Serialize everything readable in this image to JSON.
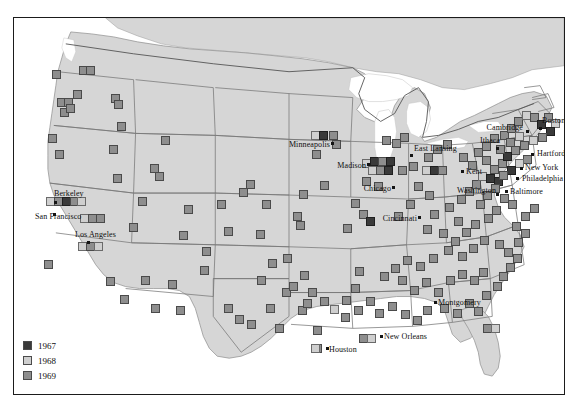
{
  "figure": {
    "type": "map",
    "title": "",
    "frame": {
      "border_color": "#1b1b1b",
      "background": "#ffffff"
    },
    "palette": {
      "land": "#d6d6d6",
      "water": "#ffffff",
      "state_border": "#6e6e6e",
      "country_border": "#555555",
      "label_text": "#0e0e0e",
      "year_1967": "#3a3a3a",
      "year_1968": "#cfcfcf",
      "year_1969": "#8e8e8e"
    }
  },
  "legend": {
    "position": "bottom-left",
    "items": [
      {
        "label": "1967",
        "color": "#3a3a3a",
        "key": "year-1967"
      },
      {
        "label": "1968",
        "color": "#cfcfcf",
        "key": "year-1968"
      },
      {
        "label": "1969",
        "color": "#8e8e8e",
        "key": "year-1969"
      }
    ]
  },
  "city_labels": [
    {
      "name": "Minneapolis",
      "text": "Minneapolis",
      "x": 316,
      "y": 127,
      "anchor": "right",
      "dot_x": 318,
      "dot_y": 125
    },
    {
      "name": "Madison",
      "text": "Madison",
      "x": 352,
      "y": 148,
      "anchor": "right",
      "dot_x": 354,
      "dot_y": 146
    },
    {
      "name": "Chicago",
      "text": "Chicago",
      "x": 377,
      "y": 171,
      "anchor": "right",
      "dot_x": 379,
      "dot_y": 169
    },
    {
      "name": "Cincinnati",
      "text": "Cincinnati",
      "x": 403,
      "y": 201,
      "anchor": "right",
      "dot_x": 405,
      "dot_y": 199
    },
    {
      "name": "East Lansing",
      "text": "East Lansing",
      "x": 400,
      "y": 131,
      "anchor": "left",
      "dot_x": 397,
      "dot_y": 137
    },
    {
      "name": "Kent",
      "text": "Kent",
      "x": 452,
      "y": 154,
      "anchor": "left",
      "dot_x": 448,
      "dot_y": 153
    },
    {
      "name": "Ithaca",
      "text": "Ithaca",
      "x": 466,
      "y": 123,
      "anchor": "left",
      "dot_x": 483,
      "dot_y": 130
    },
    {
      "name": "Cambridge",
      "text": "Cambridge",
      "x": 509,
      "y": 110,
      "anchor": "right",
      "dot_x": 513,
      "dot_y": 113
    },
    {
      "name": "Boston",
      "text": "Boston",
      "x": 528,
      "y": 103,
      "anchor": "left",
      "dot_x": 526,
      "dot_y": 110
    },
    {
      "name": "Hartford",
      "text": "Hartford",
      "x": 523,
      "y": 136,
      "anchor": "left",
      "dot_x": 518,
      "dot_y": 136
    },
    {
      "name": "New York",
      "text": "New York",
      "x": 511,
      "y": 150,
      "anchor": "left",
      "dot_x": 507,
      "dot_y": 150
    },
    {
      "name": "Philadelphia",
      "text": "Philadelphia",
      "x": 508,
      "y": 161,
      "anchor": "left",
      "dot_x": 503,
      "dot_y": 160
    },
    {
      "name": "Baltimore",
      "text": "Baltimore",
      "x": 496,
      "y": 174,
      "anchor": "left",
      "dot_x": 492,
      "dot_y": 173
    },
    {
      "name": "Washington",
      "text": "Washington",
      "x": 482,
      "y": 173,
      "anchor": "right",
      "dot_x": 483,
      "dot_y": 176
    },
    {
      "name": "Berkeley",
      "text": "Berkeley",
      "x": 40,
      "y": 176,
      "anchor": "left",
      "dot_x": 41,
      "dot_y": 184
    },
    {
      "name": "San Francisco",
      "text": "San Francisco",
      "x": 21,
      "y": 199,
      "anchor": "left",
      "dot_x": 40,
      "dot_y": 196
    },
    {
      "name": "Los Angeles",
      "text": "Los Angeles",
      "x": 61,
      "y": 217,
      "anchor": "left",
      "dot_x": 74,
      "dot_y": 224
    },
    {
      "name": "Houston",
      "text": "Houston",
      "x": 315,
      "y": 332,
      "anchor": "left",
      "dot_x": 313,
      "dot_y": 330
    },
    {
      "name": "New Orleans",
      "text": "New Orleans",
      "x": 370,
      "y": 319,
      "anchor": "left",
      "dot_x": 367,
      "dot_y": 318
    },
    {
      "name": "Montgomery",
      "text": "Montgomery",
      "x": 424,
      "y": 285,
      "anchor": "left",
      "dot_x": 421,
      "dot_y": 284
    }
  ],
  "markers": [
    {
      "year": "1969",
      "x": 42,
      "y": 56
    },
    {
      "year": "1969",
      "x": 69,
      "y": 52
    },
    {
      "year": "1969",
      "x": 76,
      "y": 52
    },
    {
      "year": "1969",
      "x": 63,
      "y": 76
    },
    {
      "year": "1969",
      "x": 47,
      "y": 84
    },
    {
      "year": "1969",
      "x": 54,
      "y": 84
    },
    {
      "year": "1969",
      "x": 50,
      "y": 94
    },
    {
      "year": "1969",
      "x": 56,
      "y": 90
    },
    {
      "year": "1969",
      "x": 101,
      "y": 80
    },
    {
      "year": "1969",
      "x": 104,
      "y": 86
    },
    {
      "year": "1969",
      "x": 107,
      "y": 108
    },
    {
      "year": "1969",
      "x": 38,
      "y": 120
    },
    {
      "year": "1969",
      "x": 45,
      "y": 136
    },
    {
      "year": "1969",
      "x": 99,
      "y": 131
    },
    {
      "year": "1968",
      "x": 36,
      "y": 183
    },
    {
      "year": "1969",
      "x": 44,
      "y": 183
    },
    {
      "year": "1967",
      "x": 52,
      "y": 183
    },
    {
      "year": "1969",
      "x": 60,
      "y": 183
    },
    {
      "year": "1968",
      "x": 67,
      "y": 183
    },
    {
      "year": "1968",
      "x": 70,
      "y": 200
    },
    {
      "year": "1969",
      "x": 78,
      "y": 200
    },
    {
      "year": "1969",
      "x": 86,
      "y": 200
    },
    {
      "year": "1968",
      "x": 68,
      "y": 228
    },
    {
      "year": "1969",
      "x": 76,
      "y": 228
    },
    {
      "year": "1968",
      "x": 84,
      "y": 228
    },
    {
      "year": "1969",
      "x": 34,
      "y": 246
    },
    {
      "year": "1969",
      "x": 103,
      "y": 160
    },
    {
      "year": "1969",
      "x": 145,
      "y": 158
    },
    {
      "year": "1969",
      "x": 140,
      "y": 150
    },
    {
      "year": "1969",
      "x": 151,
      "y": 122
    },
    {
      "year": "1969",
      "x": 207,
      "y": 186
    },
    {
      "year": "1969",
      "x": 131,
      "y": 262
    },
    {
      "year": "1969",
      "x": 158,
      "y": 266
    },
    {
      "year": "1969",
      "x": 190,
      "y": 252
    },
    {
      "year": "1969",
      "x": 258,
      "y": 245
    },
    {
      "year": "1969",
      "x": 247,
      "y": 262
    },
    {
      "year": "1969",
      "x": 272,
      "y": 274
    },
    {
      "year": "1969",
      "x": 279,
      "y": 268
    },
    {
      "year": "1969",
      "x": 288,
      "y": 292
    },
    {
      "year": "1969",
      "x": 225,
      "y": 301
    },
    {
      "year": "1969",
      "x": 192,
      "y": 233
    },
    {
      "year": "1969",
      "x": 214,
      "y": 213
    },
    {
      "year": "1969",
      "x": 246,
      "y": 216
    },
    {
      "year": "1969",
      "x": 252,
      "y": 186
    },
    {
      "year": "1969",
      "x": 174,
      "y": 191
    },
    {
      "year": "1969",
      "x": 283,
      "y": 198
    },
    {
      "year": "1969",
      "x": 289,
      "y": 176
    },
    {
      "year": "1968",
      "x": 301,
      "y": 117
    },
    {
      "year": "1967",
      "x": 309,
      "y": 117
    },
    {
      "year": "1969",
      "x": 319,
      "y": 117
    },
    {
      "year": "1969",
      "x": 322,
      "y": 126
    },
    {
      "year": "1969",
      "x": 273,
      "y": 240
    },
    {
      "year": "1969",
      "x": 290,
      "y": 257
    },
    {
      "year": "1969",
      "x": 256,
      "y": 290
    },
    {
      "year": "1969",
      "x": 265,
      "y": 310
    },
    {
      "year": "1969",
      "x": 293,
      "y": 285
    },
    {
      "year": "1969",
      "x": 303,
      "y": 312
    },
    {
      "year": "1969",
      "x": 303,
      "y": 330
    },
    {
      "year": "1968",
      "x": 301,
      "y": 330
    },
    {
      "year": "1969",
      "x": 331,
      "y": 299
    },
    {
      "year": "1969",
      "x": 341,
      "y": 270
    },
    {
      "year": "1969",
      "x": 349,
      "y": 320
    },
    {
      "year": "1968",
      "x": 357,
      "y": 320
    },
    {
      "year": "1969",
      "x": 345,
      "y": 253
    },
    {
      "year": "1968",
      "x": 352,
      "y": 145
    },
    {
      "year": "1967",
      "x": 360,
      "y": 143
    },
    {
      "year": "1969",
      "x": 368,
      "y": 143
    },
    {
      "year": "1967",
      "x": 376,
      "y": 143
    },
    {
      "year": "1968",
      "x": 358,
      "y": 152
    },
    {
      "year": "1969",
      "x": 366,
      "y": 152
    },
    {
      "year": "1967",
      "x": 374,
      "y": 152
    },
    {
      "year": "1969",
      "x": 352,
      "y": 163
    },
    {
      "year": "1969",
      "x": 364,
      "y": 168
    },
    {
      "year": "1969",
      "x": 341,
      "y": 185
    },
    {
      "year": "1969",
      "x": 349,
      "y": 196
    },
    {
      "year": "1967",
      "x": 356,
      "y": 203
    },
    {
      "year": "1969",
      "x": 333,
      "y": 210
    },
    {
      "year": "1969",
      "x": 302,
      "y": 136
    },
    {
      "year": "1969",
      "x": 310,
      "y": 167
    },
    {
      "year": "1969",
      "x": 286,
      "y": 207
    },
    {
      "year": "1969",
      "x": 372,
      "y": 122
    },
    {
      "year": "1969",
      "x": 382,
      "y": 125
    },
    {
      "year": "1969",
      "x": 390,
      "y": 119
    },
    {
      "year": "1969",
      "x": 399,
      "y": 148
    },
    {
      "year": "1969",
      "x": 388,
      "y": 152
    },
    {
      "year": "1968",
      "x": 412,
      "y": 152
    },
    {
      "year": "1967",
      "x": 420,
      "y": 152
    },
    {
      "year": "1969",
      "x": 428,
      "y": 152
    },
    {
      "year": "1969",
      "x": 414,
      "y": 139
    },
    {
      "year": "1969",
      "x": 423,
      "y": 131
    },
    {
      "year": "1969",
      "x": 433,
      "y": 126
    },
    {
      "year": "1969",
      "x": 404,
      "y": 168
    },
    {
      "year": "1969",
      "x": 415,
      "y": 177
    },
    {
      "year": "1969",
      "x": 396,
      "y": 186
    },
    {
      "year": "1969",
      "x": 384,
      "y": 198
    },
    {
      "year": "1969",
      "x": 420,
      "y": 196
    },
    {
      "year": "1969",
      "x": 413,
      "y": 211
    },
    {
      "year": "1969",
      "x": 429,
      "y": 215
    },
    {
      "year": "1969",
      "x": 444,
      "y": 203
    },
    {
      "year": "1969",
      "x": 435,
      "y": 189
    },
    {
      "year": "1969",
      "x": 447,
      "y": 181
    },
    {
      "year": "1969",
      "x": 455,
      "y": 173
    },
    {
      "year": "1969",
      "x": 462,
      "y": 166
    },
    {
      "year": "1968",
      "x": 468,
      "y": 158
    },
    {
      "year": "1969",
      "x": 458,
      "y": 147
    },
    {
      "year": "1969",
      "x": 449,
      "y": 139
    },
    {
      "year": "1969",
      "x": 464,
      "y": 134
    },
    {
      "year": "1969",
      "x": 472,
      "y": 142
    },
    {
      "year": "1967",
      "x": 476,
      "y": 160
    },
    {
      "year": "1967",
      "x": 484,
      "y": 163
    },
    {
      "year": "1969",
      "x": 480,
      "y": 151
    },
    {
      "year": "1969",
      "x": 488,
      "y": 145
    },
    {
      "year": "1969",
      "x": 472,
      "y": 128
    },
    {
      "year": "1969",
      "x": 480,
      "y": 120
    },
    {
      "year": "1969",
      "x": 490,
      "y": 117
    },
    {
      "year": "1969",
      "x": 497,
      "y": 110
    },
    {
      "year": "1969",
      "x": 504,
      "y": 103
    },
    {
      "year": "1968",
      "x": 512,
      "y": 97
    },
    {
      "year": "1969",
      "x": 520,
      "y": 99
    },
    {
      "year": "1967",
      "x": 527,
      "y": 106
    },
    {
      "year": "1969",
      "x": 534,
      "y": 99
    },
    {
      "year": "1968",
      "x": 541,
      "y": 105
    },
    {
      "year": "1967",
      "x": 536,
      "y": 113
    },
    {
      "year": "1969",
      "x": 528,
      "y": 119
    },
    {
      "year": "1968",
      "x": 519,
      "y": 122
    },
    {
      "year": "1969",
      "x": 510,
      "y": 127
    },
    {
      "year": "1969",
      "x": 501,
      "y": 132
    },
    {
      "year": "1967",
      "x": 493,
      "y": 138
    },
    {
      "year": "1969",
      "x": 486,
      "y": 131
    },
    {
      "year": "1969",
      "x": 496,
      "y": 124
    },
    {
      "year": "1968",
      "x": 505,
      "y": 118
    },
    {
      "year": "1969",
      "x": 513,
      "y": 141
    },
    {
      "year": "1968",
      "x": 505,
      "y": 145
    },
    {
      "year": "1967",
      "x": 497,
      "y": 152
    },
    {
      "year": "1969",
      "x": 489,
      "y": 157
    },
    {
      "year": "1969",
      "x": 481,
      "y": 170
    },
    {
      "year": "1969",
      "x": 473,
      "y": 177
    },
    {
      "year": "1969",
      "x": 466,
      "y": 186
    },
    {
      "year": "1969",
      "x": 490,
      "y": 180
    },
    {
      "year": "1969",
      "x": 498,
      "y": 186
    },
    {
      "year": "1969",
      "x": 482,
      "y": 192
    },
    {
      "year": "1969",
      "x": 474,
      "y": 200
    },
    {
      "year": "1969",
      "x": 461,
      "y": 206
    },
    {
      "year": "1969",
      "x": 452,
      "y": 214
    },
    {
      "year": "1969",
      "x": 441,
      "y": 223
    },
    {
      "year": "1969",
      "x": 434,
      "y": 232
    },
    {
      "year": "1969",
      "x": 448,
      "y": 238
    },
    {
      "year": "1969",
      "x": 459,
      "y": 230
    },
    {
      "year": "1969",
      "x": 470,
      "y": 222
    },
    {
      "year": "1969",
      "x": 419,
      "y": 240
    },
    {
      "year": "1969",
      "x": 406,
      "y": 248
    },
    {
      "year": "1969",
      "x": 393,
      "y": 242
    },
    {
      "year": "1969",
      "x": 381,
      "y": 250
    },
    {
      "year": "1969",
      "x": 370,
      "y": 258
    },
    {
      "year": "1969",
      "x": 388,
      "y": 262
    },
    {
      "year": "1969",
      "x": 400,
      "y": 272
    },
    {
      "year": "1969",
      "x": 412,
      "y": 264
    },
    {
      "year": "1969",
      "x": 424,
      "y": 274
    },
    {
      "year": "1969",
      "x": 436,
      "y": 262
    },
    {
      "year": "1969",
      "x": 448,
      "y": 256
    },
    {
      "year": "1969",
      "x": 460,
      "y": 262
    },
    {
      "year": "1969",
      "x": 469,
      "y": 254
    },
    {
      "year": "1969",
      "x": 455,
      "y": 285
    },
    {
      "year": "1969",
      "x": 464,
      "y": 293
    },
    {
      "year": "1969",
      "x": 443,
      "y": 295
    },
    {
      "year": "1969",
      "x": 430,
      "y": 290
    },
    {
      "year": "1969",
      "x": 413,
      "y": 292
    },
    {
      "year": "1969",
      "x": 403,
      "y": 302
    },
    {
      "year": "1969",
      "x": 391,
      "y": 296
    },
    {
      "year": "1969",
      "x": 378,
      "y": 288
    },
    {
      "year": "1969",
      "x": 365,
      "y": 295
    },
    {
      "year": "1969",
      "x": 356,
      "y": 283
    },
    {
      "year": "1969",
      "x": 344,
      "y": 292
    },
    {
      "year": "1969",
      "x": 332,
      "y": 282
    },
    {
      "year": "1968",
      "x": 320,
      "y": 291
    },
    {
      "year": "1969",
      "x": 310,
      "y": 283
    },
    {
      "year": "1969",
      "x": 298,
      "y": 274
    },
    {
      "year": "1969",
      "x": 473,
      "y": 310
    },
    {
      "year": "1968",
      "x": 481,
      "y": 310
    },
    {
      "year": "1969",
      "x": 472,
      "y": 277
    },
    {
      "year": "1969",
      "x": 483,
      "y": 268
    },
    {
      "year": "1969",
      "x": 489,
      "y": 258
    },
    {
      "year": "1969",
      "x": 496,
      "y": 249
    },
    {
      "year": "1969",
      "x": 503,
      "y": 240
    },
    {
      "year": "1969",
      "x": 494,
      "y": 234
    },
    {
      "year": "1969",
      "x": 485,
      "y": 226
    },
    {
      "year": "1969",
      "x": 504,
      "y": 224
    },
    {
      "year": "1969",
      "x": 511,
      "y": 215
    },
    {
      "year": "1969",
      "x": 502,
      "y": 208
    },
    {
      "year": "1969",
      "x": 511,
      "y": 198
    },
    {
      "year": "1969",
      "x": 520,
      "y": 190
    },
    {
      "year": "1969",
      "x": 229,
      "y": 174
    },
    {
      "year": "1969",
      "x": 236,
      "y": 166
    },
    {
      "year": "1969",
      "x": 169,
      "y": 217
    },
    {
      "year": "1969",
      "x": 119,
      "y": 209
    },
    {
      "year": "1969",
      "x": 128,
      "y": 183
    },
    {
      "year": "1969",
      "x": 96,
      "y": 263
    },
    {
      "year": "1969",
      "x": 110,
      "y": 281
    },
    {
      "year": "1969",
      "x": 141,
      "y": 290
    },
    {
      "year": "1969",
      "x": 166,
      "y": 292
    },
    {
      "year": "1969",
      "x": 214,
      "y": 290
    },
    {
      "year": "1969",
      "x": 237,
      "y": 306
    }
  ]
}
